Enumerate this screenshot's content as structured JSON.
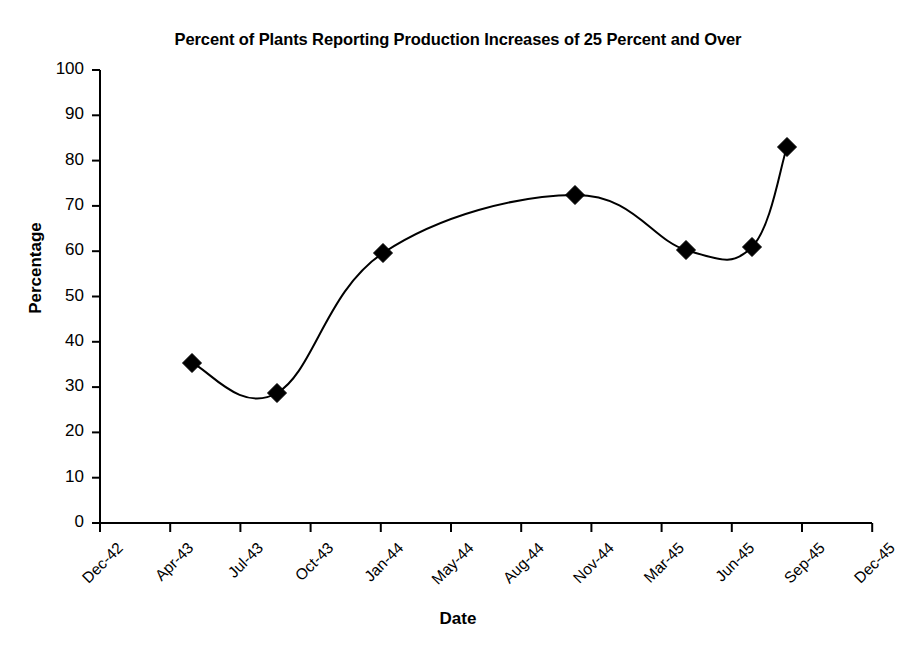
{
  "chart_data": {
    "type": "line",
    "title": "Percent of Plants Reporting Production Increases of 25 Percent and Over",
    "xlabel": "Date",
    "ylabel": "Percentage",
    "grid": false,
    "legend": "none",
    "marker": "diamond",
    "line_color": "#000000",
    "marker_color": "#000000",
    "smoothing": "spline",
    "ylim": [
      0,
      100
    ],
    "yticks": [
      0,
      10,
      20,
      30,
      40,
      50,
      60,
      70,
      80,
      90,
      100
    ],
    "ytick_labels": [
      "0",
      "10",
      "20",
      "30",
      "40",
      "50",
      "60",
      "70",
      "80",
      "90",
      "100"
    ],
    "xtick_labels": [
      "Dec-42",
      "Apr-43",
      "Jul-43",
      "Oct-43",
      "Jan-44",
      "May-44",
      "Aug-44",
      "Nov-44",
      "Mar-45",
      "Jun-45",
      "Sep-45",
      "Dec-45"
    ],
    "x": [
      "Feb-43",
      "Aug-43",
      "Jan-44",
      "Oct-44",
      "Apr-45",
      "Jul-45",
      "Aug-45"
    ],
    "values": [
      36.5,
      29,
      60,
      73,
      60.5,
      61.5,
      83
    ],
    "points": [
      {
        "label": "Feb-43",
        "value": 36.5,
        "px": 192,
        "py": 363
      },
      {
        "label": "Aug-43",
        "value": 29,
        "px": 277,
        "py": 393
      },
      {
        "label": "Jan-44",
        "value": 60,
        "px": 383,
        "py": 253
      },
      {
        "label": "Oct-44",
        "value": 73,
        "px": 575,
        "py": 195
      },
      {
        "label": "Apr-45",
        "value": 60.5,
        "px": 686,
        "py": 250
      },
      {
        "label": "Jul-45",
        "value": 61.5,
        "px": 752,
        "py": 247
      },
      {
        "label": "Aug-45",
        "value": 83,
        "px": 787,
        "py": 147
      }
    ]
  }
}
